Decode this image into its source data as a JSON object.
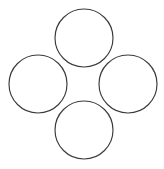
{
  "figure": {
    "canvas": {
      "width": 164,
      "height": 169,
      "background_color": "#ffffff"
    },
    "style": {
      "stroke_color": "#3a3a3a",
      "stroke_width": 1.15,
      "fill": "none"
    }
  },
  "chart_data": {
    "type": "scatter",
    "xlabel": "",
    "ylabel": "",
    "xlim": [
      0,
      164
    ],
    "ylim": [
      0,
      169
    ],
    "grid": false,
    "legend": "none",
    "shape_kind": "circle-outline",
    "units": "pixels",
    "radius": 29,
    "categories": [
      "top",
      "left",
      "right",
      "bottom"
    ],
    "series": [
      {
        "name": "circle-centers-x",
        "values": [
          84,
          38,
          128,
          84
        ]
      },
      {
        "name": "circle-centers-y",
        "values": [
          38,
          84,
          84,
          130
        ]
      },
      {
        "name": "circle-radii",
        "values": [
          29,
          29,
          29,
          29
        ]
      }
    ],
    "shapes": [
      {
        "id": "circle-top",
        "label": "top",
        "cx": 84,
        "cy": 38,
        "r": 29,
        "bbox": [
          55,
          9,
          113,
          67
        ]
      },
      {
        "id": "circle-left",
        "label": "left",
        "cx": 38,
        "cy": 84,
        "r": 29,
        "bbox": [
          9,
          55,
          67,
          113
        ]
      },
      {
        "id": "circle-right",
        "label": "right",
        "cx": 128,
        "cy": 84,
        "r": 29,
        "bbox": [
          99,
          55,
          157,
          113
        ]
      },
      {
        "id": "circle-bottom",
        "label": "bottom",
        "cx": 84,
        "cy": 130,
        "r": 29,
        "bbox": [
          55,
          101,
          113,
          159
        ]
      }
    ],
    "annotations": []
  }
}
